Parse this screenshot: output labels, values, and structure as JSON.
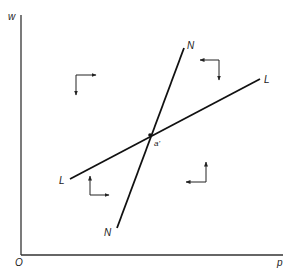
{
  "diagram": {
    "axes": {
      "y_label": "w",
      "x_label": "p",
      "origin_label": "O"
    },
    "curves": [
      {
        "id": "NN",
        "label_start": "N",
        "label_end": "N"
      },
      {
        "id": "LL",
        "label_start": "L",
        "label_end": "L"
      }
    ],
    "intersection": {
      "label": "a'"
    },
    "direction_indicators": [
      {
        "region": "upper-left",
        "horizontal": "right",
        "vertical": "down"
      },
      {
        "region": "upper-right",
        "horizontal": "left",
        "vertical": "down"
      },
      {
        "region": "lower-left",
        "horizontal": "right",
        "vertical": "up"
      },
      {
        "region": "lower-right",
        "horizontal": "left",
        "vertical": "up"
      }
    ]
  }
}
